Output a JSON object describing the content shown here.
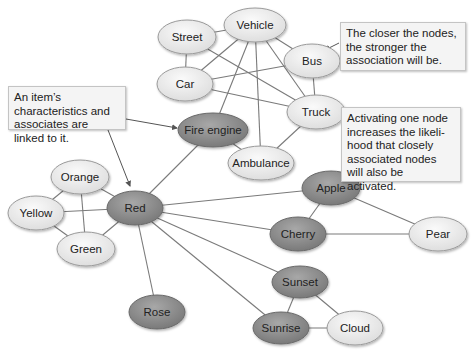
{
  "diagram": {
    "colors": {
      "light_node_fill": "#ececec",
      "dark_node_fill": "#8e8e8e",
      "node_stroke": "#9a9a9a",
      "edge": "#7a7a7a",
      "callout_bg": "#f4f4f4"
    },
    "nodes": [
      {
        "id": "vehicle",
        "label": "Vehicle",
        "x": 255,
        "y": 25,
        "rx": 31,
        "ry": 17,
        "dark": false
      },
      {
        "id": "street",
        "label": "Street",
        "x": 187,
        "y": 37,
        "rx": 29,
        "ry": 17,
        "dark": false
      },
      {
        "id": "bus",
        "label": "Bus",
        "x": 312,
        "y": 61,
        "rx": 28,
        "ry": 17,
        "dark": false
      },
      {
        "id": "car",
        "label": "Car",
        "x": 185,
        "y": 84,
        "rx": 28,
        "ry": 17,
        "dark": false
      },
      {
        "id": "truck",
        "label": "Truck",
        "x": 316,
        "y": 112,
        "rx": 29,
        "ry": 17,
        "dark": false
      },
      {
        "id": "fire_engine",
        "label": "Fire engine",
        "x": 213,
        "y": 130,
        "rx": 35,
        "ry": 17,
        "dark": true
      },
      {
        "id": "ambulance",
        "label": "Ambulance",
        "x": 261,
        "y": 163,
        "rx": 33,
        "ry": 17,
        "dark": false
      },
      {
        "id": "red",
        "label": "Red",
        "x": 135,
        "y": 208,
        "rx": 28,
        "ry": 17,
        "dark": true
      },
      {
        "id": "orange",
        "label": "Orange",
        "x": 80,
        "y": 177,
        "rx": 29,
        "ry": 17,
        "dark": false
      },
      {
        "id": "yellow",
        "label": "Yellow",
        "x": 36,
        "y": 213,
        "rx": 28,
        "ry": 17,
        "dark": false
      },
      {
        "id": "green",
        "label": "Green",
        "x": 86,
        "y": 249,
        "rx": 29,
        "ry": 17,
        "dark": false
      },
      {
        "id": "apple",
        "label": "Apple",
        "x": 331,
        "y": 188,
        "rx": 29,
        "ry": 17,
        "dark": true
      },
      {
        "id": "cherry",
        "label": "Cherry",
        "x": 298,
        "y": 234,
        "rx": 28,
        "ry": 17,
        "dark": true
      },
      {
        "id": "pear",
        "label": "Pear",
        "x": 438,
        "y": 234,
        "rx": 29,
        "ry": 17,
        "dark": false
      },
      {
        "id": "sunset",
        "label": "Sunset",
        "x": 300,
        "y": 282,
        "rx": 28,
        "ry": 16,
        "dark": true
      },
      {
        "id": "sunrise",
        "label": "Sunrise",
        "x": 281,
        "y": 328,
        "rx": 28,
        "ry": 16,
        "dark": true
      },
      {
        "id": "cloud",
        "label": "Cloud",
        "x": 355,
        "y": 328,
        "rx": 28,
        "ry": 17,
        "dark": false
      },
      {
        "id": "rose",
        "label": "Rose",
        "x": 157,
        "y": 312,
        "rx": 28,
        "ry": 17,
        "dark": true
      }
    ],
    "edges": [
      [
        "street",
        "vehicle"
      ],
      [
        "street",
        "car"
      ],
      [
        "street",
        "truck"
      ],
      [
        "vehicle",
        "bus"
      ],
      [
        "vehicle",
        "car"
      ],
      [
        "vehicle",
        "truck"
      ],
      [
        "vehicle",
        "fire_engine"
      ],
      [
        "vehicle",
        "ambulance"
      ],
      [
        "bus",
        "car"
      ],
      [
        "bus",
        "truck"
      ],
      [
        "car",
        "truck"
      ],
      [
        "truck",
        "ambulance"
      ],
      [
        "fire_engine",
        "ambulance"
      ],
      [
        "fire_engine",
        "red"
      ],
      [
        "red",
        "orange"
      ],
      [
        "red",
        "yellow"
      ],
      [
        "red",
        "green"
      ],
      [
        "orange",
        "yellow"
      ],
      [
        "orange",
        "green"
      ],
      [
        "yellow",
        "green"
      ],
      [
        "red",
        "apple"
      ],
      [
        "red",
        "cherry"
      ],
      [
        "red",
        "sunset"
      ],
      [
        "red",
        "sunrise"
      ],
      [
        "red",
        "rose"
      ],
      [
        "apple",
        "cherry"
      ],
      [
        "apple",
        "pear"
      ],
      [
        "cherry",
        "pear"
      ],
      [
        "sunset",
        "sunrise"
      ],
      [
        "sunset",
        "cloud"
      ],
      [
        "sunrise",
        "cloud"
      ]
    ],
    "callouts": [
      {
        "id": "closer",
        "text": "The closer the nodes, the stronger the association will be.",
        "x": 340,
        "y": 22,
        "w": 126,
        "h": 49,
        "arrow_from": [
          339,
          43
        ],
        "arrow_to": [
          325,
          50
        ]
      },
      {
        "id": "characteristics",
        "text": "An item’s characteristics and associates are linked to it.",
        "x": 8,
        "y": 86,
        "w": 118,
        "h": 44,
        "arrow_from": [
          126,
          119
        ],
        "arrow_to": [
          177,
          128
        ],
        "arrow2_from": [
          108,
          130
        ],
        "arrow2_to": [
          130,
          186
        ]
      },
      {
        "id": "activating",
        "text": "Activating one node increases the likeli-hood that closely associated nodes will also be activated.",
        "x": 341,
        "y": 107,
        "w": 120,
        "h": 75,
        "arrow_from": [
          359,
          182
        ],
        "arrow_to": [
          352,
          193
        ]
      }
    ]
  }
}
